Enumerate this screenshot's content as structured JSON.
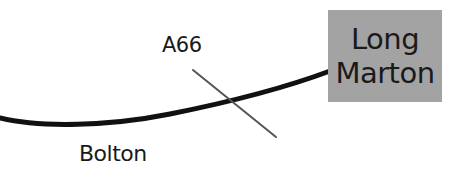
{
  "map": {
    "labels": {
      "road": "A66",
      "village": "Bolton"
    },
    "destination": {
      "line1": "Long",
      "line2": "Marton"
    },
    "colors": {
      "main_route": "#111111",
      "cross_road": "#555555",
      "destination_box": "#a3a3a3",
      "text": "#1a1a1a"
    }
  }
}
